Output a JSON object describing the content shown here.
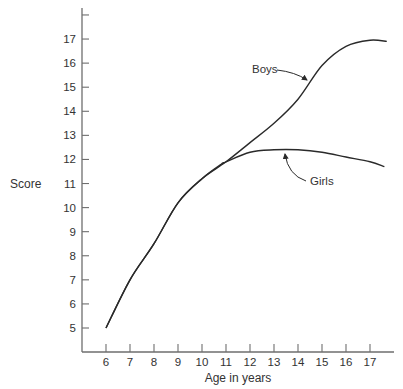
{
  "chart_data": {
    "type": "line",
    "title": "",
    "xlabel": "Age in years",
    "ylabel": "Score",
    "xlim": [
      5,
      18
    ],
    "ylim": [
      4,
      18
    ],
    "x_ticks": [
      6,
      7,
      8,
      9,
      10,
      11,
      12,
      13,
      14,
      15,
      16,
      17
    ],
    "y_ticks": [
      5,
      6,
      7,
      8,
      9,
      10,
      11,
      12,
      13,
      14,
      15,
      16,
      17,
      18
    ],
    "y_tick_labels": [
      "5",
      "6",
      "7",
      "8",
      "9",
      "10",
      "11",
      "12",
      "13",
      "14",
      "15",
      "16",
      "17",
      ""
    ],
    "grid": false,
    "legend": "none (curves labeled inline with arrows)",
    "series": [
      {
        "name": "Boys",
        "x": [
          6,
          7,
          8,
          9,
          10,
          11,
          12,
          13,
          14,
          15,
          16,
          17,
          17.7
        ],
        "values": [
          5.0,
          7.0,
          8.5,
          10.2,
          11.2,
          11.9,
          12.7,
          13.5,
          14.5,
          15.9,
          16.7,
          16.95,
          16.9
        ]
      },
      {
        "name": "Girls",
        "x": [
          6,
          7,
          8,
          9,
          10,
          10.8,
          11,
          12,
          13,
          14,
          15,
          16,
          17,
          17.6
        ],
        "values": [
          5.0,
          7.0,
          8.5,
          10.2,
          11.2,
          11.8,
          11.9,
          12.3,
          12.4,
          12.4,
          12.3,
          12.1,
          11.9,
          11.7
        ]
      }
    ],
    "annotations": [
      {
        "text": "Boys",
        "points_to_x": 14.4,
        "points_to_y": 15.2
      },
      {
        "text": "Girls",
        "points_to_x": 13.5,
        "points_to_y": 12.3
      }
    ]
  },
  "labels": {
    "ylabel": "Score",
    "xlabel": "Age in years",
    "boys": "Boys",
    "girls": "Girls"
  },
  "colors": {
    "axis": "#6e6e6e",
    "line": "#2a2a2a",
    "text": "#333333"
  }
}
